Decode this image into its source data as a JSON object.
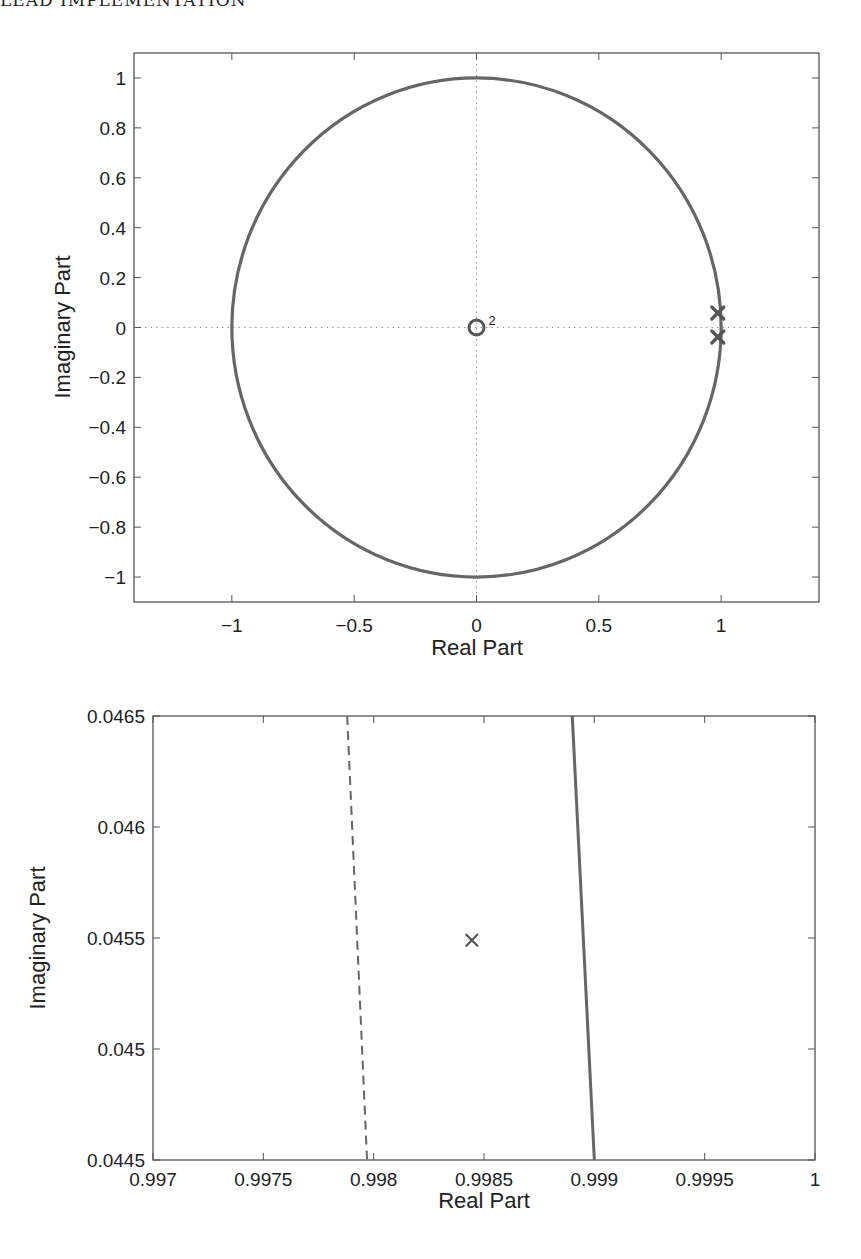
{
  "page": {
    "running_header": "LEAD IMPLEMENTATION"
  },
  "colors": {
    "axis": "#555555",
    "curve": "#666666",
    "marker": "#555555",
    "gridline": "#999999",
    "text": "#222222"
  },
  "chart_data": [
    {
      "type": "scatter",
      "title": "",
      "subtitle": "Pole-zero map with unit circle",
      "xlabel": "Real Part",
      "ylabel": "Imaginary Part",
      "xlim": [
        -1.4,
        1.4
      ],
      "ylim": [
        -1.1,
        1.1
      ],
      "grid": false,
      "legend": null,
      "xticks": [
        -1,
        -0.5,
        0,
        0.5,
        1
      ],
      "xtick_labels": [
        "−1",
        "−0.5",
        "0",
        "0.5",
        "1"
      ],
      "yticks": [
        1,
        0.8,
        0.6,
        0.4,
        0.2,
        0,
        -0.2,
        -0.4,
        -0.6,
        -0.8,
        -1
      ],
      "ytick_labels": [
        "1",
        "0.8",
        "0.6",
        "0.4",
        "0.2",
        "0",
        "−0.2",
        "−0.4",
        "−0.6",
        "−0.8",
        "−1"
      ],
      "reference_lines": [
        {
          "orientation": "horizontal",
          "value": 0,
          "style": "dotted"
        },
        {
          "orientation": "vertical",
          "value": 0,
          "style": "dotted"
        }
      ],
      "series": [
        {
          "name": "unit circle",
          "kind": "circle",
          "center": [
            0,
            0
          ],
          "radius": 1,
          "style": "solid"
        },
        {
          "name": "zeros",
          "marker": "o",
          "points": [
            [
              0,
              0
            ]
          ],
          "multiplicity": 2,
          "annotation": "2"
        },
        {
          "name": "poles",
          "marker": "x",
          "points": [
            [
              0.9985,
              0.0455
            ],
            [
              0.9985,
              -0.0455
            ]
          ]
        }
      ]
    },
    {
      "type": "line",
      "title": "",
      "subtitle": "Zoomed view near upper pole",
      "xlabel": "Real Part",
      "ylabel": "Imaginary Part",
      "xlim": [
        0.997,
        1.0
      ],
      "ylim": [
        0.0445,
        0.0465
      ],
      "grid": false,
      "legend": null,
      "xticks": [
        0.997,
        0.9975,
        0.998,
        0.9985,
        0.999,
        0.9995,
        1
      ],
      "xtick_labels": [
        "0.997",
        "0.9975",
        "0.998",
        "0.9985",
        "0.999",
        "0.9995",
        "1"
      ],
      "yticks": [
        0.0465,
        0.046,
        0.0455,
        0.045,
        0.0445
      ],
      "ytick_labels": [
        "0.0465",
        "0.046",
        "0.0455",
        "0.045",
        "0.0445"
      ],
      "series": [
        {
          "name": "dashed boundary",
          "style": "dashed",
          "x": [
            0.99788,
            0.99797
          ],
          "y": [
            0.0465,
            0.0445
          ]
        },
        {
          "name": "unit circle arc",
          "style": "solid",
          "x": [
            0.9989,
            0.999
          ],
          "y": [
            0.0465,
            0.0445
          ]
        },
        {
          "name": "pole",
          "marker": "x",
          "points": [
            [
              0.998445,
              0.04549
            ]
          ]
        }
      ]
    }
  ]
}
